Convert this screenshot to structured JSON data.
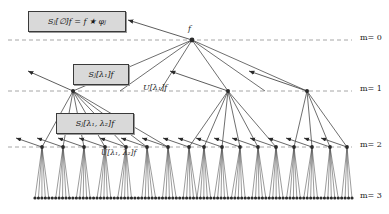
{
  "figure": {
    "type": "scattering-transform-tree",
    "background": "#ffffff",
    "node_color": "#2b2b2b",
    "edge_color": "#4a4a4a",
    "dashed_line_color": "#8f8f8f",
    "box_fill": "#d9d9d9",
    "box_border": "#3a3a3a"
  },
  "root": {
    "label": "f",
    "x": 192,
    "y": 40
  },
  "levels": [
    {
      "m_label": "m= 0",
      "y": 40,
      "node_count": 1
    },
    {
      "m_label": "m= 1",
      "y": 91,
      "node_count": 3
    },
    {
      "m_label": "m= 2",
      "y": 147,
      "node_count": 17
    },
    {
      "m_label": "m= 3",
      "y": 198,
      "node_count": 93
    }
  ],
  "boxes": [
    {
      "name": "box-sj-empty",
      "text": "S_J[∅]f = f ★ φ_J",
      "parts": [
        "S",
        "J",
        "[∅]f = f ★ φ",
        "J"
      ],
      "x": 28,
      "y": 11,
      "w": 96,
      "h": 19
    },
    {
      "name": "box-sj-lambda1",
      "text": "S_J[λ₁]f",
      "x": 73,
      "y": 64,
      "w": 54,
      "h": 19
    },
    {
      "name": "box-sj-lambda1-lambda2",
      "text": "S_J[λ₁, λ₂]f",
      "x": 56,
      "y": 113,
      "w": 76,
      "h": 19
    }
  ],
  "inline_labels": [
    {
      "name": "label-u-lambda1",
      "text": "U[λ₁]f",
      "x": 143,
      "y": 83
    },
    {
      "name": "label-u-lambda1-lambda2",
      "text": "U[λ₁, λ₂]f",
      "x": 101,
      "y": 148
    }
  ],
  "m_labels": [
    {
      "name": "m-label-0",
      "text": "m= 0",
      "x": 360,
      "y": 33
    },
    {
      "name": "m-label-1",
      "text": "m= 1",
      "x": 360,
      "y": 84
    },
    {
      "name": "m-label-2",
      "text": "m= 2",
      "x": 360,
      "y": 140
    },
    {
      "name": "m-label-3",
      "text": "m= 3",
      "x": 360,
      "y": 191
    }
  ],
  "dashed_lines": [
    {
      "name": "dashed-line-m0",
      "y": 40,
      "x1": 8,
      "x2": 352
    },
    {
      "name": "dashed-line-m1",
      "y": 91,
      "x1": 8,
      "x2": 352
    },
    {
      "name": "dashed-line-m2",
      "y": 147,
      "x1": 8,
      "x2": 352
    }
  ],
  "m1_nodes_x": [
    73,
    228,
    307
  ],
  "m2_nodes_x": [
    42,
    63,
    84,
    105,
    126,
    147,
    168,
    189,
    204,
    222,
    240,
    258,
    276,
    294,
    312,
    330,
    347
  ],
  "root_children_x": [
    73,
    228,
    307
  ],
  "arrow_head_style": "filled-triangle",
  "leaf_row": {
    "y": 198,
    "x_start": 35,
    "x_end": 352,
    "count": 93,
    "dot_radius": 1.6
  }
}
